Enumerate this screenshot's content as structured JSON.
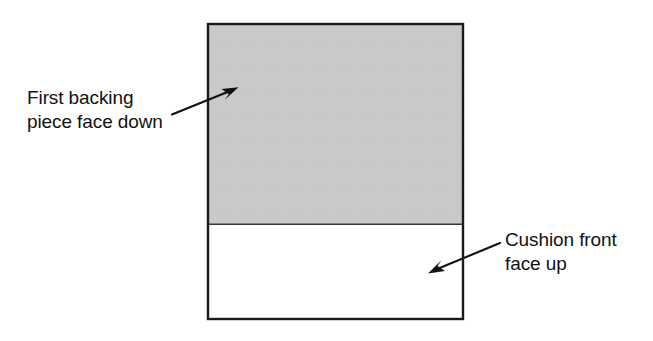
{
  "diagram": {
    "canvas": {
      "width": 653,
      "height": 341,
      "background": "#ffffff"
    },
    "panel": {
      "name": "cushion-assembly-panel",
      "x": 207,
      "y": 23,
      "width": 257,
      "height": 297,
      "border_color": "#1a1a1a",
      "border_width": 2
    },
    "regions": [
      {
        "name": "backing-piece-region",
        "fill": "#c9c9c9",
        "x": 207,
        "y": 23,
        "width": 257,
        "height": 201,
        "description": "Shaded upper area representing the first backing piece placed face down"
      },
      {
        "name": "cushion-front-region",
        "fill": "#ffffff",
        "x": 207,
        "y": 224,
        "width": 257,
        "height": 96,
        "description": "Unshaded lower area representing the cushion front placed face up"
      }
    ],
    "divider": {
      "name": "region-divider-line",
      "x1": 207,
      "y1": 224,
      "x2": 464,
      "y2": 224,
      "color": "#333333"
    },
    "labels": [
      {
        "id": "backing",
        "name": "backing-piece-label",
        "lines": [
          "First backing",
          "piece face down"
        ],
        "line1": "First backing",
        "line2": "piece face down",
        "x": 27,
        "y": 86,
        "color": "#111111"
      },
      {
        "id": "cushion",
        "name": "cushion-front-label",
        "lines": [
          "Cushion front",
          "face up"
        ],
        "line1": "Cushion front",
        "line2": "face up",
        "x": 505,
        "y": 228,
        "color": "#111111"
      }
    ],
    "arrows": [
      {
        "name": "backing-piece-arrow",
        "from": {
          "x": 172,
          "y": 114
        },
        "to": {
          "x": 237,
          "y": 88
        },
        "direction": "up-right",
        "points_to": "backing-piece-region",
        "color": "#111111"
      },
      {
        "name": "cushion-front-arrow",
        "from": {
          "x": 500,
          "y": 243
        },
        "to": {
          "x": 429,
          "y": 273
        },
        "direction": "down-left",
        "points_to": "cushion-front-region",
        "color": "#111111"
      }
    ]
  }
}
